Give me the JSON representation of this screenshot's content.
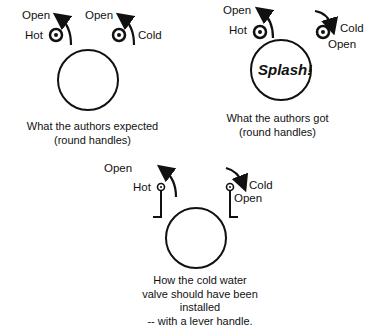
{
  "panels": {
    "expected": {
      "labels": {
        "hot_open": "Open",
        "hot": "Hot",
        "cold_open": "Open",
        "cold": "Cold"
      },
      "caption": [
        "What the authors expected",
        "(round handles)"
      ]
    },
    "got": {
      "labels": {
        "hot_open": "Open",
        "hot": "Hot",
        "cold": "Cold",
        "cold_open": "Open"
      },
      "center_text": "Splash!",
      "caption": [
        "What the authors got",
        "(round handles)"
      ]
    },
    "lever": {
      "labels": {
        "hot_open": "Open",
        "hot": "Hot",
        "cold": "Cold",
        "cold_open": "Open"
      },
      "caption": [
        "How the cold water",
        "valve should have been",
        "installed",
        "-- with a lever handle."
      ]
    }
  },
  "colors": {
    "ink": "#111111",
    "background": "#ffffff"
  }
}
